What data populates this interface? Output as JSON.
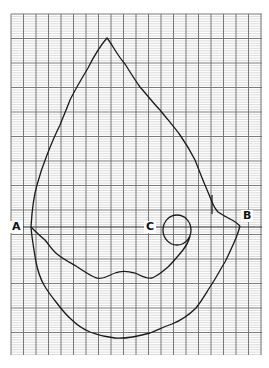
{
  "figure": {
    "type": "traced outline on graph paper",
    "background_color": "#ffffff",
    "grid": {
      "x_start": 11,
      "x_end": 262,
      "y_start": 14,
      "y_end": 355,
      "major_vertical_spacing": 12.5,
      "minor_horizontal_spacing": 2.45,
      "major_horizontal_every": 10,
      "minor_color": "#b5b5b5",
      "major_color": "#6a6a6a"
    },
    "outline_color": "#1a1a1a",
    "reference_line": {
      "from": "A",
      "to": "B",
      "y": 227
    }
  },
  "labels": {
    "a": "A",
    "b": "B",
    "c": "C"
  }
}
